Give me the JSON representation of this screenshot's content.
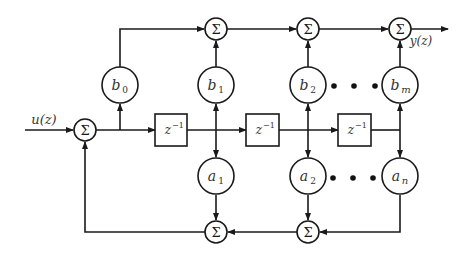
{
  "diagram": {
    "type": "signal-flow block diagram (IIR direct form II)",
    "signals": {
      "input": "u(z)",
      "output": "y(z)"
    },
    "sum_symbol": "Σ",
    "delay_label": "z",
    "delay_exponent": "−1",
    "feedforward_gains": [
      {
        "base": "b",
        "sub": "0"
      },
      {
        "base": "b",
        "sub": "1"
      },
      {
        "base": "b",
        "sub": "2"
      },
      {
        "base": "b",
        "sub": "m"
      }
    ],
    "feedback_gains": [
      {
        "base": "a",
        "sub": "1"
      },
      {
        "base": "a",
        "sub": "2"
      },
      {
        "base": "a",
        "sub": "n"
      }
    ],
    "ellipsis": "• • •",
    "colors": {
      "line": "#1a1a1a",
      "text": "#333333",
      "background": "#ffffff"
    }
  }
}
